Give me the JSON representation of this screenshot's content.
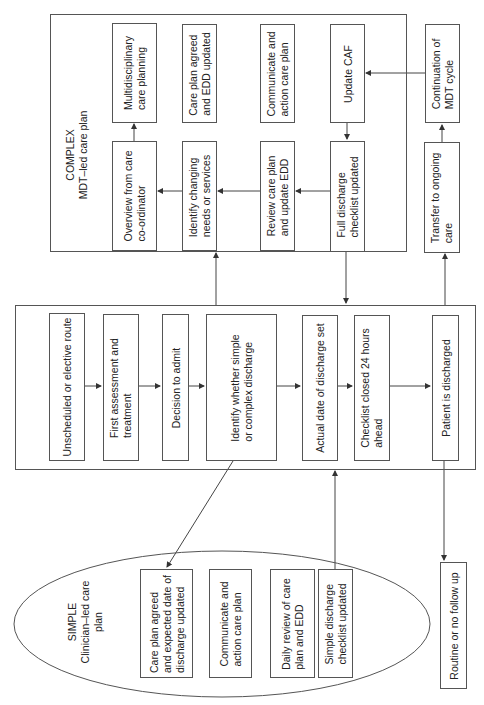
{
  "complex": {
    "title": "COMPLEX\nMDT–led care plan",
    "nodes": {
      "multidisciplinary": "Multidisciplinary\ncare planning",
      "care_plan_agreed": "Care plan agreed\nand EDD updated",
      "communicate": "Communicate and\naction care plan",
      "update_caf": "Update CAF",
      "overview": "Overview from care\nco-ordinator",
      "identify_changing": "Identify changing\nneeds or services",
      "review_care_plan": "Review care plan\nand update EDD",
      "full_discharge": "Full discharge\nchecklist updated"
    }
  },
  "side": {
    "continuation": "Continuation of\nMDT cycle",
    "transfer": "Transfer to ongoing\ncare",
    "routine": "Routine or no follow up"
  },
  "main_pathway": {
    "nodes": [
      "Unscheduled or elective route",
      "First assessment and\ntreatment",
      "Decision to admit",
      "Identify whether simple\nor complex discharge",
      "Actual date of discharge set",
      "Checklist closed 24 hours\nahead",
      "Patient is discharged"
    ]
  },
  "simple": {
    "title": "SIMPLE\nClinician–led care\nplan",
    "nodes": {
      "care_plan_agreed": "Care plan agreed\nand expected date of\ndischarge updated",
      "communicate": "Communicate and\naction care plan",
      "daily_review": "Daily review of care\nplan and EDD",
      "simple_discharge": "Simple discharge\nchecklist updated"
    }
  },
  "colors": {
    "stroke": "#555555",
    "text": "#222222",
    "background": "#ffffff"
  }
}
